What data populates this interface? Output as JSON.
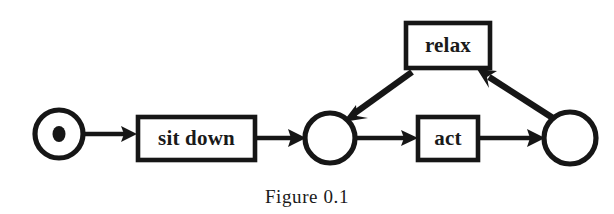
{
  "figure": {
    "caption": "Figure 0.1",
    "background_color": "#ffffff",
    "ink_color": "#161616"
  },
  "diagram": {
    "type": "petri-net",
    "places": [
      {
        "id": "p1",
        "label": "",
        "tokens": 1,
        "cx": 59,
        "cy": 134,
        "r": 24
      },
      {
        "id": "p2",
        "label": "",
        "tokens": 0,
        "cx": 330,
        "cy": 138,
        "r": 25
      },
      {
        "id": "p3",
        "label": "",
        "tokens": 0,
        "cx": 570,
        "cy": 138,
        "r": 26
      }
    ],
    "transitions": [
      {
        "id": "t_sit_down",
        "label": "sit down",
        "x": 138,
        "y": 117,
        "width": 117,
        "height": 43
      },
      {
        "id": "t_act",
        "label": "act",
        "x": 418,
        "y": 117,
        "width": 60,
        "height": 43
      },
      {
        "id": "t_relax",
        "label": "relax",
        "x": 406,
        "y": 23,
        "width": 84,
        "height": 45
      }
    ],
    "arcs": [
      {
        "id": "a1",
        "from": "p1",
        "to": "t_sit_down",
        "style": "horizontal"
      },
      {
        "id": "a2",
        "from": "t_sit_down",
        "to": "p2",
        "style": "horizontal"
      },
      {
        "id": "a3",
        "from": "p2",
        "to": "t_act",
        "style": "horizontal"
      },
      {
        "id": "a4",
        "from": "t_act",
        "to": "p3",
        "style": "horizontal"
      },
      {
        "id": "a5",
        "from": "p3",
        "to": "t_relax",
        "style": "diagonal"
      },
      {
        "id": "a6",
        "from": "t_relax",
        "to": "p2",
        "style": "diagonal"
      }
    ]
  }
}
